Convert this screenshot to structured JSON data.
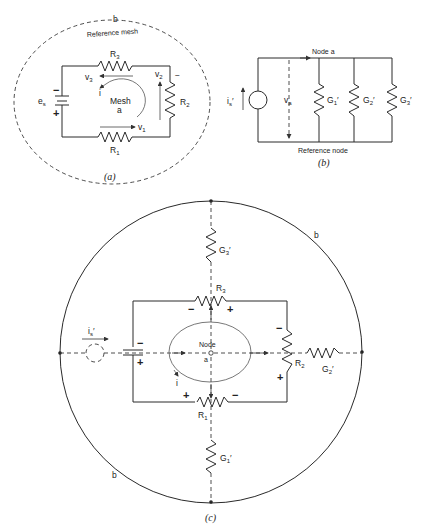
{
  "figure_a": {
    "caption": "(a)",
    "outer_label": "b",
    "reference_label": "Reference  mesh",
    "source_label": "e",
    "source_sub": "s",
    "r1": "R",
    "r1_sub": "1",
    "r2": "R",
    "r2_sub": "2",
    "r3": "R",
    "r3_sub": "3",
    "v1": "v",
    "v1_sub": "1",
    "v2": "v",
    "v2_sub": "2",
    "v3": "v",
    "v3_sub": "3",
    "current": "i",
    "mesh_label": "Mesh",
    "mesh_name": "a",
    "minus": "−",
    "plus": "+"
  },
  "figure_b": {
    "caption": "(b)",
    "node_label": "Node a",
    "reference_node": "Reference node",
    "source_label": "i",
    "source_sub": "s",
    "prime": "′",
    "voltage_label": "v",
    "voltage_sub": "a",
    "g1": "G",
    "g1_sub": "1",
    "g2": "G",
    "g2_sub": "2",
    "g3": "G",
    "g3_sub": "3"
  },
  "figure_c": {
    "caption": "(c)",
    "outer_label": "b",
    "node_label": "Node",
    "node_name": "a",
    "source_label": "i",
    "source_sub": "s",
    "prime": "′",
    "current": "i",
    "r1": "R",
    "r1_sub": "1",
    "r2": "R",
    "r2_sub": "2",
    "r3": "R",
    "r3_sub": "3",
    "g1": "G",
    "g1_sub": "1",
    "g2": "G",
    "g2_sub": "2",
    "g3": "G",
    "g3_sub": "3",
    "minus": "−",
    "plus": "+"
  }
}
